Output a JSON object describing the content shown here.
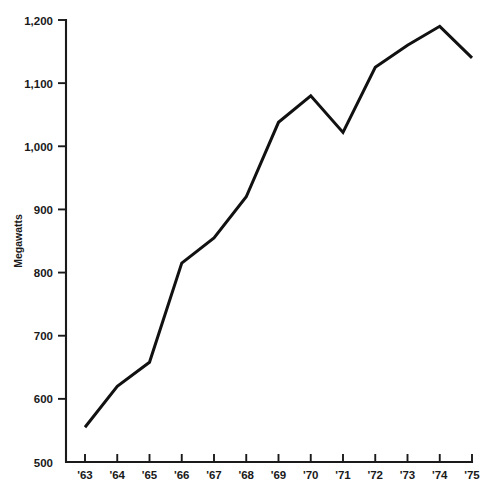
{
  "chart_data": {
    "type": "line",
    "title": "",
    "subtitle": "",
    "xlabel": "",
    "ylabel": "Megawatts",
    "x": [
      "'63",
      "'64",
      "'65",
      "'66",
      "'67",
      "'68",
      "'69",
      "'70",
      "'71",
      "'72",
      "'73",
      "'74",
      "'75"
    ],
    "categories": [
      "'63",
      "'64",
      "'65",
      "'66",
      "'67",
      "'68",
      "'69",
      "'70",
      "'71",
      "'72",
      "'73",
      "'74",
      "'75"
    ],
    "values": [
      555,
      620,
      658,
      815,
      855,
      920,
      1038,
      1080,
      1022,
      1125,
      1160,
      1190,
      1140
    ],
    "series": [
      {
        "name": "Megawatts",
        "color": "#111111",
        "values": [
          555,
          620,
          658,
          815,
          855,
          920,
          1038,
          1080,
          1022,
          1125,
          1160,
          1190,
          1140
        ]
      }
    ],
    "ylim": [
      500,
      1200
    ],
    "xlim": [
      "'63",
      "'75"
    ],
    "ytick_labels": [
      "1,200",
      "1,100",
      "1,000",
      "900",
      "800",
      "700",
      "600",
      "500"
    ],
    "ytick_values": [
      1200,
      1100,
      1000,
      900,
      800,
      700,
      600,
      500
    ],
    "xtick_labels": [
      "'63",
      "'64",
      "'65",
      "'66",
      "'67",
      "'68",
      "'69",
      "'70",
      "'71",
      "'72",
      "'73",
      "'74",
      "'75"
    ],
    "grid": false,
    "legend": false,
    "legend_position": "none",
    "line_color": "#111111",
    "axis_color": "#1a1a1a",
    "background_color": "#ffffff"
  }
}
